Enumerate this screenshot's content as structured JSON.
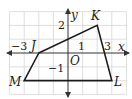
{
  "diagram": {
    "type": "coordinate-plane",
    "axes": {
      "x_label": "x",
      "y_label": "y",
      "origin_label": "O",
      "tick_labels": {
        "x_neg3": "−3",
        "x_pos1": "1",
        "x_pos3": "3",
        "y_pos2": "2",
        "y_neg1": "−1"
      },
      "x_range": [
        -4,
        4
      ],
      "y_range": [
        -3,
        3
      ]
    },
    "grid": true,
    "polygon": {
      "name": "JKLM",
      "vertices": [
        {
          "label": "J",
          "x": -2,
          "y": 0
        },
        {
          "label": "K",
          "x": 2,
          "y": 2
        },
        {
          "label": "L",
          "x": 3,
          "y": -2
        },
        {
          "label": "M",
          "x": -3,
          "y": -2
        }
      ]
    },
    "colors": {
      "grid": "#d6d6d6",
      "axis": "#333333",
      "polygon": "#1a1a1a"
    }
  }
}
